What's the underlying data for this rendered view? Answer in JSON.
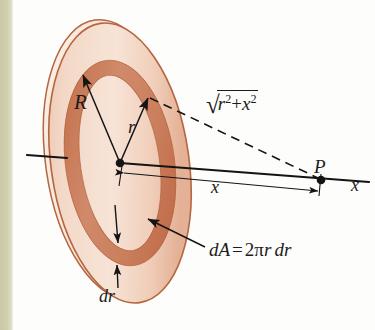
{
  "figure": {
    "labels": {
      "outer_radius": "R",
      "ring_radius": "r",
      "point": "P",
      "axis": "x",
      "distance": "x",
      "ring_thickness": "dr",
      "area_element_lhs": "dA",
      "area_element_eq": "=",
      "area_element_rhs_two": "2",
      "area_element_rhs_pi": "π",
      "area_element_rhs_r": "r",
      "area_element_rhs_dr": "dr",
      "hypotenuse_radical": "√",
      "hypotenuse_r": "r",
      "hypotenuse_exp_r": "2",
      "hypotenuse_plus": "+",
      "hypotenuse_x": "x",
      "hypotenuse_exp_x": "2"
    },
    "colors": {
      "disk_face_light": "#f3d9c9",
      "disk_face_light_2": "#eec6b2",
      "ring_dark": "#cd7f5f",
      "ring_dark_2": "#c3714f",
      "disk_edge": "#b5653f",
      "rim_highlight": "#faece1",
      "line_black": "#141414",
      "page_background": "#fdfdfb",
      "margin_strip": "#cfcfae"
    },
    "geometry": {
      "disk_center_x": 120,
      "disk_center_y": 163,
      "disk_semi_major_y": 141,
      "disk_semi_minor_x": 69,
      "point_P_x": 321,
      "point_P_y": 180,
      "disk_tilt_degrees": -8
    }
  }
}
